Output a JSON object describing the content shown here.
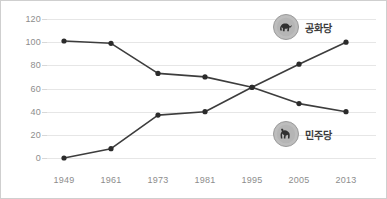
{
  "chart_data": {
    "type": "line",
    "title": "",
    "subtitle": "",
    "xlabel": "",
    "ylabel": "",
    "categories": [
      "1949",
      "1961",
      "1973",
      "1981",
      "1995",
      "2005",
      "2013"
    ],
    "x_values": [
      1949,
      1961,
      1973,
      1981,
      1995,
      2005,
      2013
    ],
    "ylim": [
      0,
      120
    ],
    "y_ticks": [
      0,
      20,
      40,
      60,
      80,
      100,
      120
    ],
    "grid": true,
    "legend_position": "inside-right",
    "series": [
      {
        "name": "공화당",
        "icon": "elephant-icon",
        "values": [
          0,
          8,
          37,
          40,
          61,
          81,
          100
        ],
        "color": "#3d3d3d"
      },
      {
        "name": "민주당",
        "icon": "donkey-icon",
        "values": [
          101,
          99,
          73,
          70,
          61,
          47,
          40
        ],
        "color": "#3d3d3d"
      }
    ]
  },
  "axes": {
    "y_tick_labels": [
      "120",
      "100",
      "80",
      "60",
      "40",
      "20",
      "0"
    ],
    "x_tick_labels": [
      "1949",
      "1961",
      "1973",
      "1981",
      "1995",
      "2005",
      "2013"
    ]
  },
  "legend": {
    "republican": {
      "label": "공화당",
      "icon": "elephant-icon"
    },
    "democrat": {
      "label": "민주당",
      "icon": "donkey-icon"
    }
  },
  "colors": {
    "line": "#3d3d3d",
    "marker": "#2b2b2b",
    "grid": "#e6e6e6",
    "tick_text": "#8d8d8d",
    "legend_text": "#3a3a3a",
    "legend_badge": "#bdbdbd",
    "border": "#cfcfcf",
    "background": "#ffffff"
  }
}
